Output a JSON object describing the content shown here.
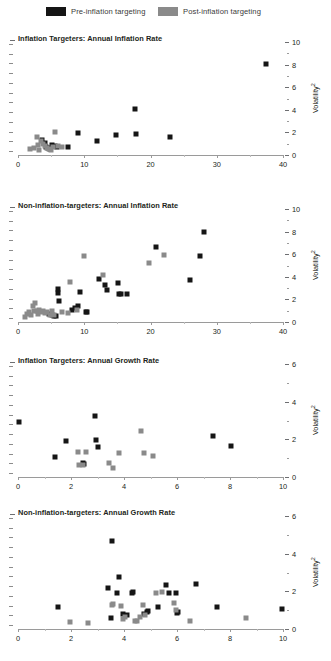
{
  "legend": {
    "items": [
      {
        "label": "Pre-inflation targeting",
        "color": "#151515",
        "key": "pre"
      },
      {
        "label": "Post-inflation targeting",
        "color": "#8a8a8a",
        "key": "post"
      }
    ]
  },
  "axis_title": "Volatility",
  "axis_title_sup": "2",
  "chart_data": [
    {
      "type": "scatter",
      "title": "Inflation Targeters: Annual Inflation Rate",
      "xlabel": "",
      "ylabel": "Volatility^2",
      "xlim": [
        0,
        40
      ],
      "ylim": [
        0,
        10
      ],
      "xticks": [
        0,
        10,
        20,
        30,
        40
      ],
      "yticks": [
        0,
        2,
        4,
        6,
        8,
        10
      ],
      "grid": false,
      "legend_position": "top",
      "series": [
        {
          "name": "Pre-inflation targeting",
          "color": "#151515",
          "points": [
            [
              3.6,
              1.35
            ],
            [
              4.0,
              1.05
            ],
            [
              4.3,
              0.72
            ],
            [
              4.6,
              0.62
            ],
            [
              4.9,
              0.55
            ],
            [
              5.2,
              0.85
            ],
            [
              5.6,
              0.78
            ],
            [
              5.9,
              0.74
            ],
            [
              7.5,
              0.72
            ],
            [
              9.1,
              1.95
            ],
            [
              11.9,
              1.25
            ],
            [
              14.8,
              1.75
            ],
            [
              17.6,
              4.05
            ],
            [
              17.8,
              1.85
            ],
            [
              23.0,
              1.6
            ],
            [
              37.5,
              8.05
            ]
          ]
        },
        {
          "name": "Post-inflation targeting",
          "color": "#8a8a8a",
          "points": [
            [
              1.8,
              0.5
            ],
            [
              2.4,
              0.62
            ],
            [
              2.8,
              1.6
            ],
            [
              3.0,
              0.9
            ],
            [
              3.2,
              0.45
            ],
            [
              3.5,
              1.25
            ],
            [
              3.8,
              0.95
            ],
            [
              4.1,
              0.8
            ],
            [
              4.4,
              0.58
            ],
            [
              4.7,
              0.5
            ],
            [
              5.0,
              0.42
            ],
            [
              5.3,
              0.68
            ],
            [
              5.6,
              2.0
            ],
            [
              6.0,
              0.8
            ],
            [
              6.6,
              0.72
            ]
          ]
        }
      ]
    },
    {
      "type": "scatter",
      "title": "Non-inflation-targeters: Annual Inflation Rate",
      "xlabel": "",
      "ylabel": "Volatility^2",
      "xlim": [
        0,
        40
      ],
      "ylim": [
        0,
        10
      ],
      "xticks": [
        0,
        10,
        20,
        30,
        40
      ],
      "yticks": [
        0,
        2,
        4,
        6,
        8,
        10
      ],
      "grid": false,
      "legend_position": "top",
      "series": [
        {
          "name": "Pre-inflation targeting",
          "color": "#151515",
          "points": [
            [
              4.7,
              0.72
            ],
            [
              5.1,
              0.6
            ],
            [
              5.4,
              0.55
            ],
            [
              5.7,
              0.5
            ],
            [
              6.1,
              2.6
            ],
            [
              6.1,
              2.95
            ],
            [
              6.2,
              1.85
            ],
            [
              8.2,
              1.1
            ],
            [
              8.6,
              1.25
            ],
            [
              9.0,
              1.45
            ],
            [
              9.3,
              2.65
            ],
            [
              10.2,
              0.88
            ],
            [
              10.4,
              0.88
            ],
            [
              12.3,
              3.85
            ],
            [
              13.1,
              3.25
            ],
            [
              13.5,
              2.85
            ],
            [
              15.1,
              3.45
            ],
            [
              15.3,
              2.5
            ],
            [
              15.6,
              2.5
            ],
            [
              16.4,
              2.45
            ],
            [
              20.9,
              6.6
            ],
            [
              25.9,
              3.7
            ],
            [
              27.4,
              5.85
            ],
            [
              28.1,
              7.95
            ]
          ]
        },
        {
          "name": "Post-inflation targeting",
          "color": "#8a8a8a",
          "points": [
            [
              1.0,
              0.45
            ],
            [
              1.3,
              0.75
            ],
            [
              1.6,
              0.9
            ],
            [
              2.0,
              0.6
            ],
            [
              2.3,
              1.45
            ],
            [
              2.4,
              0.95
            ],
            [
              2.6,
              1.7
            ],
            [
              2.8,
              1.0
            ],
            [
              3.0,
              0.72
            ],
            [
              3.2,
              1.1
            ],
            [
              3.5,
              0.85
            ],
            [
              3.8,
              0.95
            ],
            [
              4.1,
              0.78
            ],
            [
              4.4,
              0.85
            ],
            [
              4.8,
              0.62
            ],
            [
              5.2,
              0.95
            ],
            [
              5.5,
              0.6
            ],
            [
              6.7,
              0.85
            ],
            [
              7.6,
              0.82
            ],
            [
              7.8,
              3.55
            ],
            [
              8.9,
              1.1
            ],
            [
              10.0,
              5.85
            ],
            [
              12.9,
              4.2
            ],
            [
              19.7,
              5.25
            ],
            [
              22.0,
              5.9
            ]
          ]
        }
      ]
    },
    {
      "type": "scatter",
      "title": "Inflation Targeters: Annual Growth Rate",
      "xlabel": "",
      "ylabel": "Volatility^2",
      "xlim": [
        0,
        10
      ],
      "ylim": [
        0,
        6
      ],
      "xticks": [
        0,
        2,
        4,
        6,
        8,
        10
      ],
      "yticks": [
        0,
        2,
        4,
        6
      ],
      "grid": false,
      "legend_position": "top",
      "series": [
        {
          "name": "Pre-inflation targeting",
          "color": "#151515",
          "points": [
            [
              0.02,
              2.9
            ],
            [
              1.4,
              1.05
            ],
            [
              1.8,
              1.9
            ],
            [
              2.45,
              0.72
            ],
            [
              2.5,
              0.68
            ],
            [
              2.9,
              3.25
            ],
            [
              2.95,
              1.95
            ],
            [
              3.0,
              1.6
            ],
            [
              7.35,
              2.2
            ],
            [
              8.05,
              1.65
            ]
          ]
        },
        {
          "name": "Post-inflation targeting",
          "color": "#8a8a8a",
          "points": [
            [
              2.25,
              1.35
            ],
            [
              2.3,
              0.65
            ],
            [
              2.45,
              0.62
            ],
            [
              2.55,
              1.35
            ],
            [
              3.45,
              0.75
            ],
            [
              3.6,
              0.5
            ],
            [
              3.8,
              1.3
            ],
            [
              4.65,
              2.45
            ],
            [
              4.75,
              1.25
            ],
            [
              5.1,
              1.1
            ]
          ]
        }
      ]
    },
    {
      "type": "scatter",
      "title": "Non-inflation-targeters: Annual Growth Rate",
      "xlabel": "",
      "ylabel": "Volatility^2",
      "xlim": [
        0,
        10
      ],
      "ylim": [
        0,
        6
      ],
      "xticks": [
        0,
        2,
        4,
        6,
        8,
        10
      ],
      "yticks": [
        0,
        2,
        4,
        6
      ],
      "grid": false,
      "legend_position": "top",
      "series": [
        {
          "name": "Pre-inflation targeting",
          "color": "#151515",
          "points": [
            [
              1.5,
              1.15
            ],
            [
              3.4,
              2.2
            ],
            [
              3.5,
              0.6
            ],
            [
              3.55,
              4.65
            ],
            [
              3.75,
              1.9
            ],
            [
              3.8,
              2.75
            ],
            [
              3.95,
              0.78
            ],
            [
              4.1,
              0.72
            ],
            [
              4.3,
              1.9
            ],
            [
              4.35,
              1.95
            ],
            [
              4.75,
              0.82
            ],
            [
              4.85,
              0.9
            ],
            [
              4.9,
              0.95
            ],
            [
              5.3,
              1.15
            ],
            [
              5.6,
              2.35
            ],
            [
              5.7,
              1.9
            ],
            [
              5.95,
              1.9
            ],
            [
              6.0,
              0.85
            ],
            [
              6.05,
              0.88
            ],
            [
              6.7,
              2.4
            ],
            [
              7.5,
              1.15
            ],
            [
              9.95,
              1.05
            ]
          ]
        },
        {
          "name": "Post-inflation targeting",
          "color": "#8a8a8a",
          "points": [
            [
              1.95,
              0.35
            ],
            [
              2.65,
              0.3
            ],
            [
              3.55,
              1.25
            ],
            [
              3.6,
              1.35
            ],
            [
              3.9,
              1.2
            ],
            [
              3.95,
              0.52
            ],
            [
              4.05,
              0.62
            ],
            [
              4.4,
              0.45
            ],
            [
              4.5,
              0.4
            ],
            [
              4.6,
              0.65
            ],
            [
              4.7,
              1.25
            ],
            [
              4.8,
              0.72
            ],
            [
              5.2,
              1.9
            ],
            [
              5.45,
              1.95
            ],
            [
              5.9,
              1.4
            ],
            [
              5.95,
              1.0
            ],
            [
              6.5,
              0.4
            ],
            [
              8.6,
              0.6
            ]
          ]
        }
      ]
    }
  ]
}
